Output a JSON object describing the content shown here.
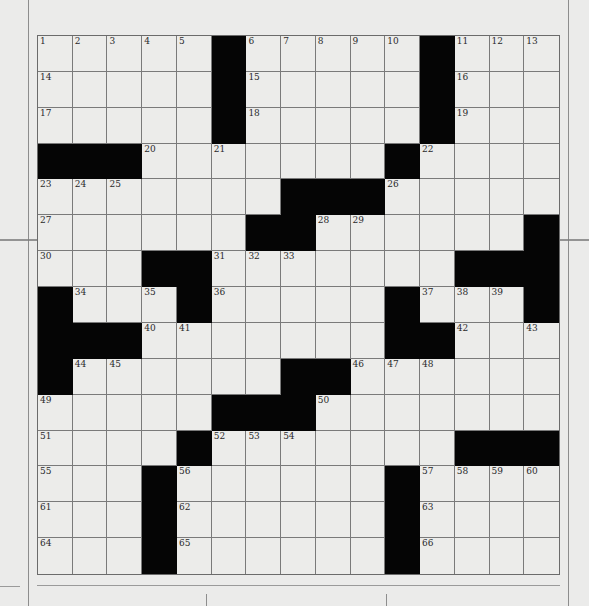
{
  "puzzle": {
    "type": "crossword",
    "rows": 15,
    "cols": 15,
    "colors": {
      "background": "#ebebea",
      "cell": "#ececea",
      "block": "#050505",
      "gridline": "#7a7a7a"
    },
    "blocks": [
      [
        5,
        11
      ],
      [
        5,
        11
      ],
      [
        5,
        11
      ],
      [
        0,
        1,
        2,
        10
      ],
      [
        7,
        8,
        9
      ],
      [
        6,
        7,
        14
      ],
      [
        3,
        4,
        12,
        13,
        14
      ],
      [
        0,
        4,
        10,
        14
      ],
      [
        0,
        1,
        2,
        10,
        11
      ],
      [
        0,
        7,
        8
      ],
      [
        5,
        6,
        7
      ],
      [
        4,
        12,
        13,
        14
      ],
      [
        3,
        10
      ],
      [
        3,
        10
      ],
      [
        3,
        10
      ]
    ],
    "numbers": [
      "1",
      "2",
      "3",
      "4",
      "5",
      "6",
      "7",
      "8",
      "9",
      "10",
      "11",
      "12",
      "13",
      "14",
      "15",
      "16",
      "17",
      "18",
      "19",
      "20",
      "21",
      "22",
      "23",
      "24",
      "25",
      "26",
      "27",
      "28",
      "29",
      "30",
      "31",
      "32",
      "33",
      "34",
      "35",
      "36",
      "37",
      "38",
      "39",
      "40",
      "41",
      "42",
      "43",
      "44",
      "45",
      "46",
      "47",
      "48",
      "49",
      "50",
      "51",
      "52",
      "53",
      "54",
      "55",
      "56",
      "57",
      "58",
      "59",
      "60",
      "61",
      "62",
      "63",
      "64",
      "65",
      "66"
    ]
  }
}
